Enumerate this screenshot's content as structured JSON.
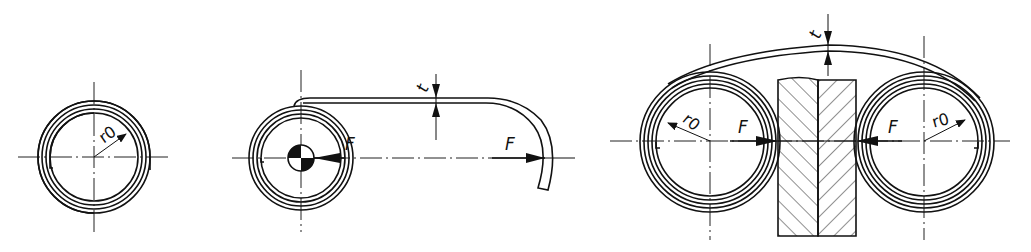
{
  "figure": {
    "colors": {
      "ink": "#111111",
      "background": "#ffffff"
    },
    "view_1": {
      "title": "free spiral spring",
      "radius_label": "r0"
    },
    "view_2": {
      "title": "spring extended over drum",
      "force_label_drum": "F",
      "force_label_end": "F",
      "thickness_label": "t",
      "symbol": "centre-of-mass-icon"
    },
    "view_3": {
      "title": "two coils on pressed plates",
      "radius_label_left": "r0",
      "radius_label_right": "r0",
      "force_label_left": "F",
      "force_label_right": "F",
      "thickness_label": "t"
    }
  }
}
